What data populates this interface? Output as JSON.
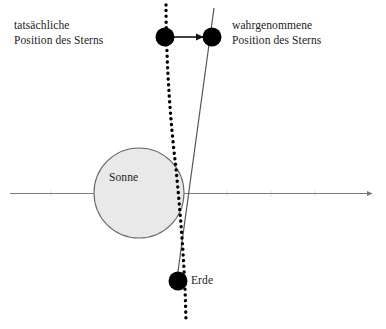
{
  "figure": {
    "background_color": "#ffffff",
    "width": 386,
    "height": 329
  },
  "labels": {
    "actual_star": {
      "line1": "tatsächliche",
      "line2": "Position des Sterns"
    },
    "apparent_star": {
      "line1": "wahrgenommene",
      "line2": "Position des Sterns"
    },
    "sun": "Sonne",
    "earth": "Erde"
  },
  "colors": {
    "ink": "#1a1a1a",
    "sun_fill": "#e9e9e9",
    "sun_stroke": "#6a6a6a",
    "axis": "#7a7a7a",
    "dot": "#000000",
    "solid_ray": "#555555",
    "dotted_ray": "#000000"
  },
  "geometry": {
    "axis": {
      "y": 193,
      "x_start": 10,
      "x_end": 374,
      "arrowhead": "right"
    },
    "sun": {
      "cx": 139,
      "cy": 193,
      "r": 45
    },
    "star_actual_dot": {
      "cx": 165,
      "cy": 37,
      "r": 9
    },
    "star_apparent_dot": {
      "cx": 212,
      "cy": 37,
      "r": 9
    },
    "earth_dot": {
      "cx": 178,
      "cy": 281,
      "r": 9
    },
    "connector_arrow": {
      "from_x": 174,
      "from_y": 37,
      "to_x": 203,
      "to_y": 37
    },
    "dotted_ray_path": "M 166 5 C 166 5 168 95 176 168 C 181 215 185 265 186 322",
    "solid_ray_path": "M 214 8 L 176 285"
  }
}
